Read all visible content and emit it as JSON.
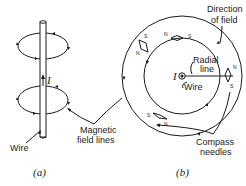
{
  "figure": {
    "panel_a": {
      "caption": "(a)",
      "current_label": "I",
      "wire_label": "Wire",
      "field_lines_label_line1": "Magnetic",
      "field_lines_label_line2": "field lines"
    },
    "panel_b": {
      "caption": "(b)",
      "current_label": "I",
      "wire_label": "Wire",
      "direction_label_line1": "Direction",
      "direction_label_line2": "of field",
      "radial_label_line1": "Radial",
      "radial_label_line2": "line",
      "compass_label_line1": "Compass",
      "compass_label_line2": "needles",
      "needle_poles": {
        "outer_top_left_s": "S",
        "outer_top_left_n": "N",
        "inner_top_n": "N",
        "inner_top_s": "S",
        "right_n": "N",
        "right_s": "S",
        "bottom_s": "S",
        "bottom_n": "N"
      }
    },
    "colors": {
      "ink": "#1a1a1a",
      "background": "#ffffff"
    }
  }
}
